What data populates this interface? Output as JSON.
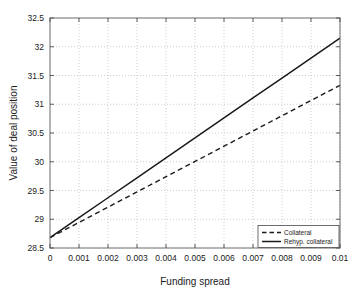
{
  "chart_data": {
    "type": "line",
    "title": "",
    "xlabel": "Funding spread",
    "ylabel": "Value of deal position",
    "xlim": [
      0,
      0.01
    ],
    "ylim": [
      28.5,
      32.5
    ],
    "grid": true,
    "legend_position": "lower right",
    "xticks": [
      0,
      0.001,
      0.002,
      0.003,
      0.004,
      0.005,
      0.006,
      0.007,
      0.008,
      0.009,
      0.01
    ],
    "xticklabels": [
      "0",
      "0.001",
      "0.002",
      "0.003",
      "0.004",
      "0.005",
      "0.006",
      "0.007",
      "0.008",
      "0.009",
      "0.01"
    ],
    "yticks": [
      28.5,
      29,
      29.5,
      30,
      30.5,
      31,
      31.5,
      32,
      32.5
    ],
    "yticklabels": [
      "28.5",
      "29",
      "29.5",
      "30",
      "30.5",
      "31",
      "31.5",
      "32",
      "32.5"
    ],
    "x": [
      0,
      0.001,
      0.002,
      0.003,
      0.004,
      0.005,
      0.006,
      0.007,
      0.008,
      0.009,
      0.01
    ],
    "series": [
      {
        "name": "Collateral",
        "style": "dashed",
        "color": "#1a1a1a",
        "values": [
          28.68,
          28.945,
          29.21,
          29.475,
          29.74,
          30.005,
          30.27,
          30.535,
          30.8,
          31.065,
          31.33
        ]
      },
      {
        "name": "Rehyp. collateral",
        "style": "solid",
        "color": "#1a1a1a",
        "values": [
          28.68,
          29.027,
          29.374,
          29.721,
          30.068,
          30.415,
          30.762,
          31.109,
          31.456,
          31.803,
          32.15
        ]
      }
    ]
  },
  "legend": {
    "entries": [
      {
        "label": "Collateral",
        "style": "dashed"
      },
      {
        "label": "Rehyp. collateral",
        "style": "solid"
      }
    ]
  },
  "axes": {
    "x_title": "Funding spread",
    "y_title": "Value of deal position"
  }
}
